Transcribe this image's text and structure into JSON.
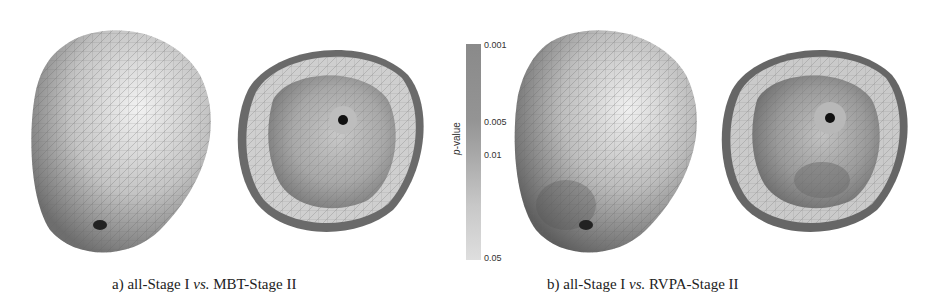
{
  "figure": {
    "panels": [
      {
        "id": "a",
        "caption_prefix": "a) all-Stage I ",
        "caption_vs": "vs.",
        "caption_suffix": " MBT-Stage II",
        "views": [
          "epicardial-exterior-view",
          "interior-endocardial-view"
        ]
      },
      {
        "id": "b",
        "caption_prefix": "b) all-Stage I ",
        "caption_vs": "vs.",
        "caption_suffix": " RVPA-Stage II",
        "views": [
          "epicardial-exterior-view",
          "interior-endocardial-view"
        ]
      }
    ],
    "colorbar": {
      "title_italic": "p",
      "title_rest": "-value",
      "ticks": [
        "0.001",
        "0.005",
        "0.01",
        "0.05"
      ],
      "color_high_significance": "#8a8a8a",
      "color_low_significance": "#dedede"
    }
  }
}
